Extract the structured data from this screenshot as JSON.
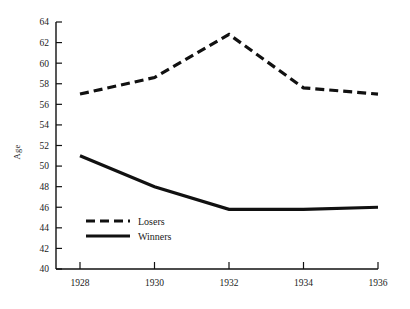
{
  "chart_data": {
    "type": "line",
    "title": "",
    "subtitle": "",
    "xlabel": "",
    "ylabel": "Age",
    "x": [
      1928,
      1930,
      1932,
      1934,
      1936
    ],
    "xtick_labels": [
      "1928",
      "1930",
      "1932",
      "1934",
      "1936"
    ],
    "xlim": [
      1928,
      1936
    ],
    "ylim": [
      40,
      64
    ],
    "ytick_labels": [
      "40",
      "42",
      "44",
      "46",
      "48",
      "50",
      "52",
      "54",
      "56",
      "58",
      "60",
      "62",
      "64"
    ],
    "ytick_values": [
      40,
      42,
      44,
      46,
      48,
      50,
      52,
      54,
      56,
      58,
      60,
      62,
      64
    ],
    "grid": false,
    "legend_position": "inside-lower-left",
    "series": [
      {
        "name": "Losers",
        "style": "dashed",
        "color": "#111111",
        "values": [
          57.0,
          58.6,
          62.8,
          57.6,
          57.0
        ]
      },
      {
        "name": "Winners",
        "style": "solid",
        "color": "#111111",
        "values": [
          51.0,
          48.0,
          45.8,
          45.8,
          46.0
        ]
      }
    ]
  },
  "legend": {
    "entries": [
      {
        "label": "Losers",
        "style": "dashed"
      },
      {
        "label": "Winners",
        "style": "solid"
      }
    ]
  }
}
